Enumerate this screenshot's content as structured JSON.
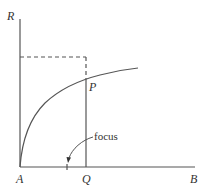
{
  "diagram": {
    "type": "geometric-construction",
    "colors": {
      "background": "#ffffff",
      "stroke": "#555555",
      "text": "#333333"
    },
    "axes": {
      "vertical_label": "R",
      "horizontal_label": "B",
      "origin_label": "A"
    },
    "points": {
      "P": "P",
      "Q": "Q"
    },
    "annotation": {
      "text": "focus"
    },
    "elements": [
      "vertical axis from A up to R",
      "horizontal axis from A to B",
      "curve rising from A, concave, passing through P",
      "vertical line from Q up through P",
      "dashed rectangle corner: horizontal dashed line from R-axis to above P, then dashed down to P",
      "arrow from 'focus' label pointing to a tick mark on AB between A and Q"
    ]
  }
}
